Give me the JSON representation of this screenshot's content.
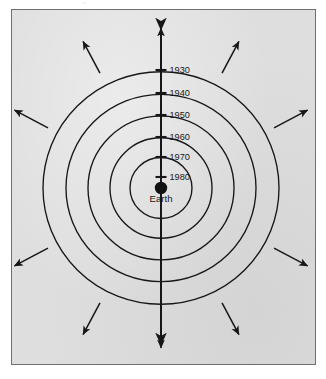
{
  "figure": {
    "title_visible": false,
    "scan_artifact_text": "· = ·",
    "panel": {
      "background_color": "#dedede",
      "border_color": "#6e6e73",
      "x": 11,
      "y": 9,
      "width": 305,
      "height": 356
    },
    "center_label": "Earth",
    "center": {
      "x": 161,
      "y": 188
    },
    "axis": {
      "name": "vertical-time-axis",
      "top_y": 30,
      "bottom_y": 345,
      "color": "#17171a",
      "arrow_up": true,
      "arrow_down": true
    },
    "year_ticks": [
      {
        "label": "1930",
        "y": 70,
        "radius": 118
      },
      {
        "label": "1940",
        "y": 93,
        "radius": 95
      },
      {
        "label": "1950",
        "y": 115,
        "radius": 73
      },
      {
        "label": "1960",
        "y": 137,
        "radius": 51
      },
      {
        "label": "1970",
        "y": 157,
        "radius": 31
      },
      {
        "label": "1980",
        "y": 177,
        "radius": 11
      }
    ],
    "wavefront_circles": [
      {
        "year": "1930",
        "radius": 118
      },
      {
        "year": "1940",
        "radius": 95
      },
      {
        "year": "1950",
        "radius": 73
      },
      {
        "year": "1960",
        "radius": 51
      },
      {
        "year": "1970",
        "radius": 31
      }
    ],
    "earth_dot": {
      "radius": 6.2,
      "color": "#111114"
    },
    "expansion_arrows": [
      {
        "name": "arrow-n",
        "angle_deg": -90,
        "start_r": 128,
        "end_r": 160
      },
      {
        "name": "arrow-nne",
        "angle_deg": -62,
        "start_r": 130,
        "end_r": 166
      },
      {
        "name": "arrow-ene",
        "angle_deg": -28,
        "start_r": 128,
        "end_r": 166
      },
      {
        "name": "arrow-ese",
        "angle_deg": 28,
        "start_r": 128,
        "end_r": 166
      },
      {
        "name": "arrow-sse",
        "angle_deg": 62,
        "start_r": 130,
        "end_r": 166
      },
      {
        "name": "arrow-s",
        "angle_deg": 90,
        "start_r": 130,
        "end_r": 160
      },
      {
        "name": "arrow-ssw",
        "angle_deg": 118,
        "start_r": 130,
        "end_r": 166
      },
      {
        "name": "arrow-wsw",
        "angle_deg": 152,
        "start_r": 128,
        "end_r": 166
      },
      {
        "name": "arrow-wnw",
        "angle_deg": 208,
        "start_r": 128,
        "end_r": 166
      },
      {
        "name": "arrow-nnw",
        "angle_deg": 242,
        "start_r": 130,
        "end_r": 166
      }
    ],
    "colors": {
      "ink": "#17171a",
      "panel_fill": "#dedede",
      "panel_border": "#6e6e73",
      "page": "#ffffff"
    }
  },
  "chart_data": {
    "type": "scatter",
    "xlabel": "",
    "ylabel": "",
    "categories": [
      "1930",
      "1940",
      "1950",
      "1960",
      "1970",
      "1980"
    ],
    "values": [
      118,
      95,
      73,
      51,
      31,
      11
    ],
    "series": [
      {
        "name": "Wavefront radius (px from Earth)",
        "values": [
          118,
          95,
          73,
          51,
          31,
          11
        ]
      }
    ],
    "annotations": [
      "Earth"
    ],
    "grid": false,
    "legend": "none"
  }
}
